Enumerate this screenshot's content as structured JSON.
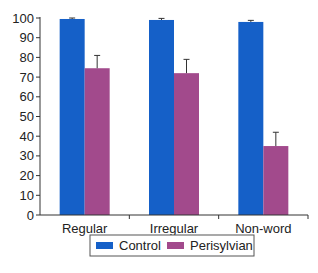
{
  "chart_data": {
    "type": "bar",
    "title": "",
    "xlabel": "",
    "ylabel": "",
    "ylim": [
      0,
      100
    ],
    "yticks": [
      0,
      10,
      20,
      30,
      40,
      50,
      60,
      70,
      80,
      90,
      100
    ],
    "categories": [
      "Regular",
      "Irregular",
      "Non-word"
    ],
    "series": [
      {
        "name": "Control",
        "color": "#1560c8",
        "values": [
          99.5,
          99,
          98
        ],
        "error": [
          0.5,
          0.8,
          0.8
        ]
      },
      {
        "name": "Perisylvian",
        "color": "#a24a8c",
        "values": [
          74.5,
          72,
          35
        ],
        "error": [
          6.5,
          7,
          7
        ]
      }
    ],
    "grid": false,
    "legend_position": "bottom"
  }
}
